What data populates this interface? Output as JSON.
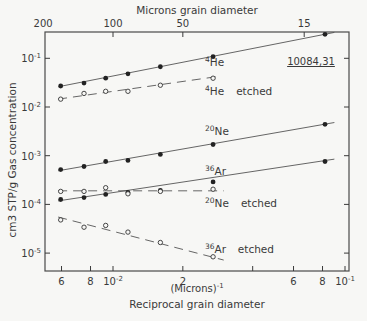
{
  "chart_data": {
    "type": "scatter",
    "title": "",
    "sample_id": "10084,31",
    "xlabel_unit": "(Microns)",
    "xlabel_unit_exp": "-1",
    "xlabel": "Reciprocal grain diameter",
    "x2label": "Microns grain diameter",
    "ylabel": "cm3 STP/g  Gas  concentration",
    "xscale": "log",
    "yscale": "log",
    "xlim": [
      0.0053,
      0.105
    ],
    "ylim": [
      4.2e-06,
      0.36
    ],
    "grid": false,
    "x_ticks_bottom": [
      {
        "value": 0.006,
        "label": "6"
      },
      {
        "value": 0.008,
        "label": "8"
      },
      {
        "value": 0.01,
        "label": "10",
        "exp": "-2"
      },
      {
        "value": 0.02,
        "label": "2"
      },
      {
        "value": 0.04,
        "label": ""
      },
      {
        "value": 0.06,
        "label": "6"
      },
      {
        "value": 0.08,
        "label": "8"
      },
      {
        "value": 0.1,
        "label": "10",
        "exp": "-1"
      }
    ],
    "x_ticks_top": [
      {
        "value": 0.005,
        "label": "200"
      },
      {
        "value": 0.01,
        "label": "100"
      },
      {
        "value": 0.02,
        "label": "50"
      },
      {
        "value": 0.0667,
        "label": "15"
      }
    ],
    "y_ticks": [
      {
        "value": 0.1,
        "label": "10",
        "exp": "-1"
      },
      {
        "value": 0.01,
        "label": "10",
        "exp": "-2"
      },
      {
        "value": 0.001,
        "label": "10",
        "exp": "-3"
      },
      {
        "value": 0.0001,
        "label": "10",
        "exp": "-4"
      },
      {
        "value": 1e-05,
        "label": "10",
        "exp": "-5"
      }
    ],
    "series": [
      {
        "name": "4He",
        "label_sup": "4",
        "label_main": "He",
        "label_suffix": "",
        "marker": "filled",
        "line": "solid",
        "x": [
          0.00595,
          0.0075,
          0.0093,
          0.0116,
          0.016,
          0.027,
          0.082
        ],
        "y": [
          0.027,
          0.031,
          0.039,
          0.048,
          0.067,
          0.108,
          0.31
        ]
      },
      {
        "name": "4He etched",
        "label_sup": "4",
        "label_main": "He",
        "label_suffix": "etched",
        "marker": "open",
        "line": "dashed",
        "x": [
          0.00595,
          0.0075,
          0.0093,
          0.0116,
          0.016,
          0.027
        ],
        "y": [
          0.0145,
          0.019,
          0.021,
          0.021,
          0.028,
          0.039
        ]
      },
      {
        "name": "20Ne",
        "label_sup": "20",
        "label_main": "Ne",
        "label_suffix": "",
        "marker": "filled",
        "line": "solid",
        "x": [
          0.00595,
          0.0075,
          0.0093,
          0.0116,
          0.016,
          0.027,
          0.082
        ],
        "y": [
          0.00052,
          0.0006,
          0.00076,
          0.0008,
          0.00106,
          0.0017,
          0.0044
        ]
      },
      {
        "name": "36Ar",
        "label_sup": "36",
        "label_main": "Ar",
        "label_suffix": "",
        "marker": "filled",
        "line": "solid",
        "x": [
          0.00595,
          0.0075,
          0.0093,
          0.0116,
          0.016,
          0.027,
          0.082
        ],
        "y": [
          0.000126,
          0.000138,
          0.00016,
          0.000176,
          0.000194,
          0.00029,
          0.00076
        ]
      },
      {
        "name": "20Ne etched",
        "label_sup": "20",
        "label_main": "Ne",
        "label_suffix": "etched",
        "marker": "open",
        "line": "dashed",
        "x": [
          0.00595,
          0.0075,
          0.0093,
          0.0116,
          0.016,
          0.027
        ],
        "y": [
          0.000185,
          0.000185,
          0.00022,
          0.000165,
          0.000185,
          0.000205
        ]
      },
      {
        "name": "36Ar etched",
        "label_sup": "36",
        "label_main": "Ar",
        "label_suffix": "etched",
        "marker": "open",
        "line": "dashed",
        "x": [
          0.00595,
          0.0075,
          0.0093,
          0.0116,
          0.016,
          0.027
        ],
        "y": [
          4.8e-05,
          3.4e-05,
          3.7e-05,
          2.7e-05,
          1.65e-05,
          8.4e-06
        ]
      }
    ],
    "fit_lines": [
      {
        "series": "4He",
        "x": [
          0.0058,
          0.09
        ],
        "y": [
          0.026,
          0.34
        ]
      },
      {
        "series": "4He etched",
        "x": [
          0.0058,
          0.028
        ],
        "y": [
          0.0145,
          0.042
        ]
      },
      {
        "series": "20Ne",
        "x": [
          0.0058,
          0.09
        ],
        "y": [
          0.00049,
          0.0048
        ]
      },
      {
        "series": "36Ar",
        "x": [
          0.0058,
          0.09
        ],
        "y": [
          0.000118,
          0.00085
        ]
      },
      {
        "series": "20Ne etched",
        "x": [
          0.0058,
          0.03
        ],
        "y": [
          0.00019,
          0.00019
        ]
      },
      {
        "series": "36Ar etched",
        "x": [
          0.0058,
          0.03
        ],
        "y": [
          5.5e-05,
          7.2e-06
        ]
      }
    ]
  }
}
